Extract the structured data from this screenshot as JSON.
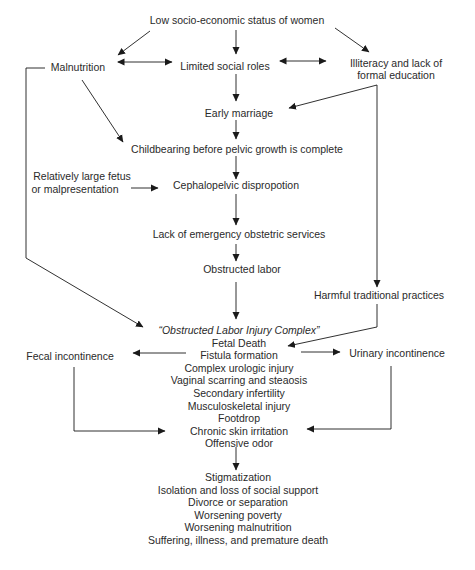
{
  "diagram": {
    "type": "flowchart",
    "nodes": {
      "root": "Low socio-economic status of women",
      "malnutrition": "Malnutrition",
      "limited_roles": "Limited social roles",
      "illiteracy": [
        "Illiteracy and lack of",
        "formal education"
      ],
      "early_marriage": "Early marriage",
      "childbearing": "Childbearing before pelvic growth is complete",
      "large_fetus": [
        "Relatively large fetus",
        "or malpresentation"
      ],
      "cpd": "Cephalopelvic dispropotion",
      "lack_services": "Lack of emergency obstetric services",
      "obstructed_labor": "Obstructed labor",
      "harmful_practices": "Harmful traditional practices",
      "fecal": "Fecal incontinence",
      "urinary": "Urinary incontinence",
      "olic": {
        "title": "“Obstructed Labor Injury Complex”",
        "items": [
          "Fetal Death",
          "Fistula formation",
          "Complex urologic injury",
          "Vaginal scarring and steaosis",
          "Secondary infertility",
          "Musculoskeletal injury",
          "Footdrop",
          "Chronic skin irritation",
          "Offensive odor"
        ]
      },
      "consequences": {
        "items": [
          "Stigmatization",
          "Isolation and loss of social support",
          "Divorce or separation",
          "Worsening poverty",
          "Worsening malnutrition",
          "Suffering, illness, and premature death"
        ]
      }
    },
    "edges": [
      {
        "from": "root",
        "to": "malnutrition"
      },
      {
        "from": "root",
        "to": "limited_roles"
      },
      {
        "from": "root",
        "to": "illiteracy"
      },
      {
        "from": "malnutrition",
        "to": "limited_roles",
        "bidirectional": true
      },
      {
        "from": "limited_roles",
        "to": "illiteracy",
        "bidirectional": true
      },
      {
        "from": "limited_roles",
        "to": "early_marriage"
      },
      {
        "from": "illiteracy",
        "to": "early_marriage"
      },
      {
        "from": "illiteracy",
        "to": "harmful_practices"
      },
      {
        "from": "malnutrition",
        "to": "childbearing"
      },
      {
        "from": "malnutrition",
        "to": "olic"
      },
      {
        "from": "early_marriage",
        "to": "childbearing"
      },
      {
        "from": "childbearing",
        "to": "cpd"
      },
      {
        "from": "large_fetus",
        "to": "cpd"
      },
      {
        "from": "cpd",
        "to": "lack_services"
      },
      {
        "from": "lack_services",
        "to": "obstructed_labor"
      },
      {
        "from": "obstructed_labor",
        "to": "olic"
      },
      {
        "from": "harmful_practices",
        "to": "olic"
      },
      {
        "from": "olic",
        "to": "fecal"
      },
      {
        "from": "olic",
        "to": "urinary"
      },
      {
        "from": "fecal",
        "to": "olic_skin"
      },
      {
        "from": "urinary",
        "to": "olic_skin"
      },
      {
        "from": "olic",
        "to": "consequences"
      }
    ],
    "colors": {
      "text": "#2a2a2a",
      "line": "#1a1a1a",
      "background": "#ffffff"
    }
  }
}
